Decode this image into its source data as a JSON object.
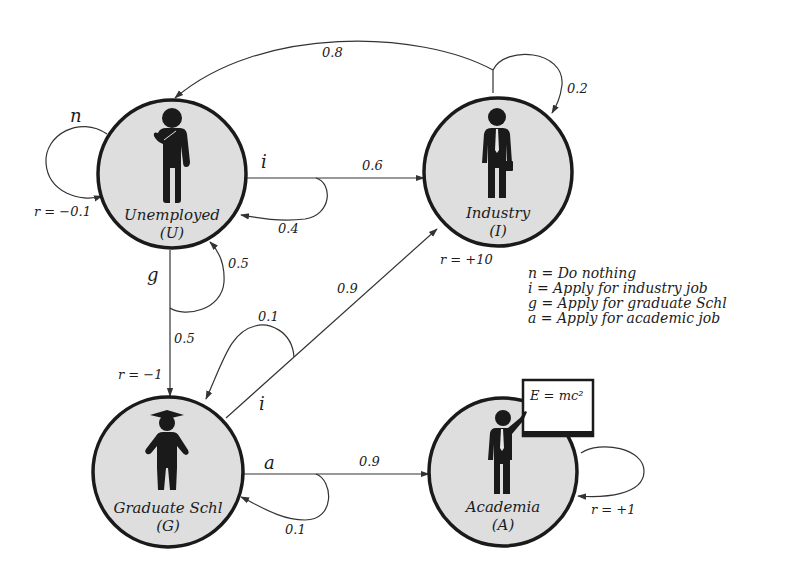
{
  "diagram": {
    "type": "markov-decision-process",
    "states": [
      {
        "id": "U",
        "name": "Unemployed",
        "symbol": "(U)",
        "icon": "thinking-person-icon",
        "reward": "r = −0.1"
      },
      {
        "id": "I",
        "name": "Industry",
        "symbol": "(I)",
        "icon": "businessman-icon",
        "reward": "r = +10"
      },
      {
        "id": "G",
        "name": "Graduate Schl",
        "symbol": "(G)",
        "icon": "graduate-student-icon",
        "reward": "r = −1"
      },
      {
        "id": "A",
        "name": "Academia",
        "symbol": "(A)",
        "icon": "teacher-icon",
        "reward": "r = +1",
        "board_text": "E = mc²"
      }
    ],
    "actions": [
      {
        "from": "U",
        "label": "n"
      },
      {
        "from": "U",
        "label": "i"
      },
      {
        "from": "U",
        "label": "g"
      },
      {
        "from": "G",
        "label": "i"
      },
      {
        "from": "G",
        "label": "a"
      }
    ],
    "transitions": [
      {
        "from": "U",
        "action": "n",
        "to": "U",
        "p": null
      },
      {
        "from": "U",
        "action": "i",
        "to": "I",
        "p": "0.6"
      },
      {
        "from": "U",
        "action": "i",
        "to": "U",
        "p": "0.4"
      },
      {
        "from": "U",
        "action": "g",
        "to": "G",
        "p": "0.5"
      },
      {
        "from": "U",
        "action": "g",
        "to": "U",
        "p": "0.5"
      },
      {
        "from": "I",
        "action": null,
        "to": "U",
        "p": "0.8"
      },
      {
        "from": "I",
        "action": null,
        "to": "I",
        "p": "0.2"
      },
      {
        "from": "G",
        "action": "i",
        "to": "I",
        "p": "0.9"
      },
      {
        "from": "G",
        "action": "i",
        "to": "G",
        "p": "0.1"
      },
      {
        "from": "G",
        "action": "a",
        "to": "A",
        "p": "0.9"
      },
      {
        "from": "G",
        "action": "a",
        "to": "G",
        "p": "0.1"
      },
      {
        "from": "A",
        "action": null,
        "to": "A",
        "p": null
      }
    ],
    "labels": {
      "p_I_U": "0.8",
      "p_I_I": "0.2",
      "p_U_I": "0.6",
      "p_U_U_i": "0.4",
      "p_U_U_g": "0.5",
      "p_U_G": "0.5",
      "p_G_G_i": "0.1",
      "p_G_I": "0.9",
      "p_G_A": "0.9",
      "p_G_G_a": "0.1",
      "act_n": "n",
      "act_i_U": "i",
      "act_g": "g",
      "act_i_G": "i",
      "act_a": "a"
    },
    "legend": [
      "n = Do nothing",
      "i = Apply for industry job",
      "g = Apply for graduate Schl",
      "a = Apply for academic job"
    ]
  }
}
